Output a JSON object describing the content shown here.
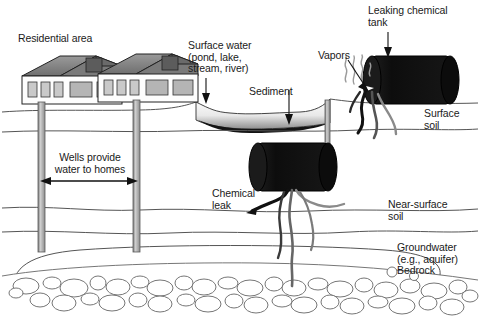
{
  "figure": {
    "background_color": "#ffffff",
    "line_color": "#555555",
    "text_color": "#1a1a1a",
    "tank_color": "#111111",
    "roof_color": "#8a8a8a",
    "well_color": "#a8a8a8"
  },
  "labels": {
    "residential_area": "Residential area",
    "surface_water": "Surface water\n(pond, lake,\nstream, river)",
    "sediment": "Sediment",
    "vapors": "Vapors",
    "leaking_tank": "Leaking chemical\ntank",
    "surface_soil": "Surface\nsoil",
    "wells": "Wells provide\nwater to homes",
    "chemical_leak": "Chemical\nleak",
    "near_surface_soil": "Near-surface\nsoil",
    "groundwater": "Groundwater\n(e.g., aquifer)",
    "bedrock": "Bedrock"
  },
  "elements": {
    "house_left": "house",
    "house_right": "house",
    "well_left": "well-pipe",
    "well_right": "well-pipe",
    "buried_tank": "buried-chemical-tank",
    "surface_tank": "surface-chemical-tank",
    "pond": "surface-water-body",
    "sediment_layer": "pond-sediment",
    "bedrock_cobbles": "bedrock-cobble-layer",
    "span_arrow": "wells-span-arrow"
  }
}
